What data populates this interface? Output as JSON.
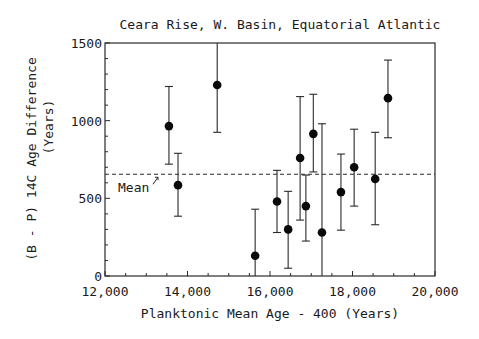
{
  "chart_data": {
    "type": "scatter",
    "title": "Ceara Rise, W. Basin, Equatorial Atlantic",
    "xlabel": "Planktonic Mean Age - 400 (Years)",
    "ylabel": "(B - P) 14C Age Difference (Years)",
    "ylabel_line1": "(B - P)  14C Age Difference",
    "ylabel_line2": "(Years)",
    "xlim": [
      12000,
      20000
    ],
    "ylim": [
      0,
      1500
    ],
    "x_ticks": [
      "12,000",
      "14,000",
      "16,000",
      "18,000",
      "20,000"
    ],
    "y_ticks": [
      "0",
      "500",
      "1000",
      "1500"
    ],
    "grid": false,
    "mean_line": {
      "label": "Mean",
      "value": 655
    },
    "series": [
      {
        "name": "B-P age difference",
        "points": [
          {
            "x": 13550,
            "y": 965,
            "err_low": 720,
            "err_high": 1220
          },
          {
            "x": 13770,
            "y": 585,
            "err_low": 385,
            "err_high": 790
          },
          {
            "x": 14720,
            "y": 1230,
            "err_low": 925,
            "err_high": 1500
          },
          {
            "x": 15640,
            "y": 130,
            "err_low": 0,
            "err_high": 430
          },
          {
            "x": 16170,
            "y": 480,
            "err_low": 280,
            "err_high": 680
          },
          {
            "x": 16440,
            "y": 300,
            "err_low": 50,
            "err_high": 545
          },
          {
            "x": 16730,
            "y": 760,
            "err_low": 360,
            "err_high": 1155
          },
          {
            "x": 16870,
            "y": 450,
            "err_low": 225,
            "err_high": 650
          },
          {
            "x": 17050,
            "y": 915,
            "err_low": 670,
            "err_high": 1170
          },
          {
            "x": 17260,
            "y": 280,
            "err_low": 0,
            "err_high": 980
          },
          {
            "x": 17720,
            "y": 540,
            "err_low": 295,
            "err_high": 785
          },
          {
            "x": 18040,
            "y": 700,
            "err_low": 450,
            "err_high": 945
          },
          {
            "x": 18550,
            "y": 625,
            "err_low": 330,
            "err_high": 925
          },
          {
            "x": 18860,
            "y": 1145,
            "err_low": 890,
            "err_high": 1390
          }
        ]
      }
    ]
  }
}
